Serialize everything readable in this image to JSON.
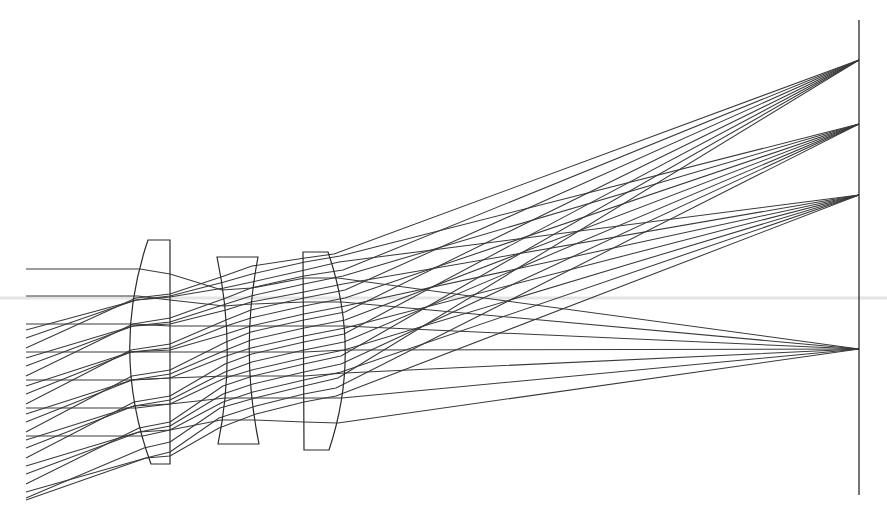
{
  "diagram": {
    "type": "optical-ray-diagram",
    "colors": {
      "rays": "#3a3a3a",
      "lenses": "#2a2a2a",
      "background": "#ffffff",
      "artifact_band": "#d9d9d9"
    },
    "image_plane": {
      "x": 859,
      "y_top": 20,
      "y_bottom": 495
    },
    "artifact_band": {
      "y": 298,
      "x1": 0,
      "x2": 887
    },
    "lenses": [
      {
        "name": "lens-1-plano-convex",
        "path": "M148,240 L170,240 L170,464 L151,464 Q110,352 148,240 Z"
      },
      {
        "name": "lens-2-biconcave",
        "path": "M217,257 L258,257 Q240,351 259,444 L218,444 Q237,351 217,257 Z"
      },
      {
        "name": "lens-3-plano-convex",
        "path": "M303,252 L328,252 Q362,351 329,450 L304,450 Z"
      }
    ],
    "focal_points": [
      {
        "name": "focus-field-3",
        "x": 859,
        "y": 60
      },
      {
        "name": "focus-field-2",
        "x": 859,
        "y": 124
      },
      {
        "name": "focus-field-1",
        "x": 859,
        "y": 195
      },
      {
        "name": "focus-on-axis",
        "x": 859,
        "y": 349
      }
    ],
    "bundles": [
      {
        "name": "on-axis",
        "focus_y": 349,
        "rays": [
          "26,269 140,269 170,274 222,290 252,288 305,278 338,278 859,349",
          "26,296 138,296 170,300 224,306 252,304 304,302 342,302 859,349",
          "26,324 133,324 170,326 226,326 251,326 304,326 344,326 859,349",
          "26,352 131,352 170,352 226,352 251,352 304,352 345,350 859,349",
          "26,380 132,380 170,378 226,376 251,376 304,376 345,373 859,349",
          "26,408 136,408 170,404 225,398 252,398 304,398 342,398 859,349",
          "26,436 143,436 170,430 221,420 255,420 304,422 338,423 859,349"
        ]
      },
      {
        "name": "field-1",
        "focus_y": 195,
        "rays": [
          "26,330 137,300 170,297 224,288 252,282 305,270 339,262 859,195",
          "26,358 133,326 170,324 226,310 251,302 304,292 343,284 859,195",
          "26,386 131,352 170,350 226,334 251,326 304,314 345,306 859,195",
          "26,414 132,380 170,378 226,356 251,348 304,336 345,328 859,195",
          "26,440 134,406 170,404 225,378 252,370 304,358 344,350 859,195",
          "26,466 139,432 170,430 223,402 253,392 304,380 341,372 859,195",
          "26,492 146,458 170,456 219,428 256,414 304,402 336,396 859,195"
        ]
      },
      {
        "name": "field-2",
        "focus_y": 124,
        "rays": [
          "26,338 136,300 170,296 224,282 252,274 305,262 340,256 859,124",
          "26,366 133,326 170,322 226,304 251,296 304,284 343,276 859,124",
          "26,394 131,352 170,348 226,326 251,318 304,306 345,298 859,124",
          "26,422 132,380 170,374 226,350 251,340 304,328 345,320 859,124",
          "26,448 134,406 170,400 225,372 252,362 304,350 344,342 859,124",
          "26,474 139,432 170,426 223,394 253,384 304,372 341,364 859,124",
          "26,500 146,458 170,452 219,418 256,406 304,394 336,388 859,124"
        ]
      },
      {
        "name": "field-3",
        "focus_y": 60,
        "rays": [
          "26,348 136,298 170,294 224,276 252,266 305,258 334,254 859,60",
          "26,376 133,324 170,318 226,298 251,288 304,276 343,270 859,60",
          "26,404 131,350 170,344 226,320 251,310 304,298 345,290 859,60",
          "26,432 132,376 170,370 226,342 251,332 304,320 345,312 859,60",
          "26,458 134,402 170,396 225,364 252,354 304,342 344,334 859,60",
          "26,484 139,428 170,422 223,386 253,376 304,364 341,356 859,60",
          "26,498 144,448 170,442 220,408 255,398 304,386 338,378 859,60"
        ]
      }
    ]
  }
}
